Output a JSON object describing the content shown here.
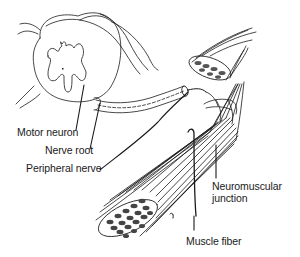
{
  "diagram": {
    "colors": {
      "ink": "#1a1a1a",
      "background": "#ffffff"
    },
    "labels": {
      "motor_neuron": "Motor neuron",
      "nerve_root": "Nerve root",
      "peripheral_nerve": "Peripheral nerve",
      "neuromuscular_junction_line1": "Neuromuscular",
      "neuromuscular_junction_line2": "junction",
      "muscle_fiber": "Muscle fiber"
    },
    "structures": [
      "spinal-cord-cross-section",
      "nerve-root",
      "peripheral-nerve",
      "muscle-bundle-small",
      "muscle-bundle-large",
      "neuromuscular-junction"
    ]
  }
}
